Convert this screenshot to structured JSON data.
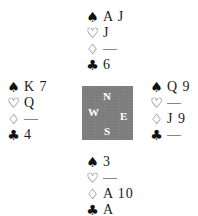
{
  "suit_symbols": {
    "spades": "♠",
    "hearts": "♡",
    "diamonds": "♢",
    "clubs": "♣"
  },
  "compass": {
    "north": "N",
    "south": "S",
    "east": "E",
    "west": "W",
    "background_color": "#7d7d7d"
  },
  "hands": {
    "north": {
      "spades": "A J",
      "hearts": "J",
      "diamonds": "—",
      "clubs": "6"
    },
    "west": {
      "spades": "K 7",
      "hearts": "Q",
      "diamonds": "—",
      "clubs": "4"
    },
    "east": {
      "spades": "Q 9",
      "hearts": "—",
      "diamonds": "J 9",
      "clubs": "—"
    },
    "south": {
      "spades": "3",
      "hearts": "—",
      "diamonds": "A 10",
      "clubs": "A"
    }
  }
}
